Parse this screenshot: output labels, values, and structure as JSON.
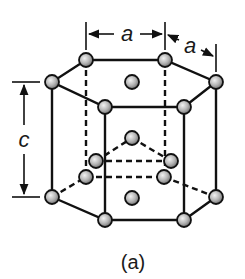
{
  "figure": {
    "caption": "(a)",
    "dimension_labels": {
      "a_top": "a",
      "a_side": "a",
      "c": "c"
    },
    "colors": {
      "atom_light": "#e6e6e6",
      "atom_dark": "#7a7a7a",
      "line": "#111111",
      "background": "#ffffff"
    },
    "atoms": {
      "top_layer": [
        {
          "name": "top-back-left",
          "x": 86,
          "y": 60
        },
        {
          "name": "top-back-right",
          "x": 165,
          "y": 60
        },
        {
          "name": "top-left",
          "x": 52,
          "y": 82
        },
        {
          "name": "top-right",
          "x": 216,
          "y": 82
        },
        {
          "name": "top-front-left",
          "x": 105,
          "y": 107
        },
        {
          "name": "top-front-right",
          "x": 184,
          "y": 107
        },
        {
          "name": "top-center",
          "x": 132,
          "y": 82
        }
      ],
      "middle_layer": [
        {
          "name": "mid-back",
          "x": 132,
          "y": 138
        },
        {
          "name": "mid-left-back",
          "x": 96,
          "y": 161
        },
        {
          "name": "mid-right-back",
          "x": 171,
          "y": 161
        },
        {
          "name": "mid-left-front",
          "x": 86,
          "y": 177
        },
        {
          "name": "mid-right-front",
          "x": 164,
          "y": 177
        }
      ],
      "bottom_layer": [
        {
          "name": "bottom-left",
          "x": 52,
          "y": 197
        },
        {
          "name": "bottom-right",
          "x": 216,
          "y": 197
        },
        {
          "name": "bottom-front-left",
          "x": 105,
          "y": 220
        },
        {
          "name": "bottom-front-right",
          "x": 184,
          "y": 220
        },
        {
          "name": "bottom-center",
          "x": 132,
          "y": 198
        }
      ]
    }
  }
}
